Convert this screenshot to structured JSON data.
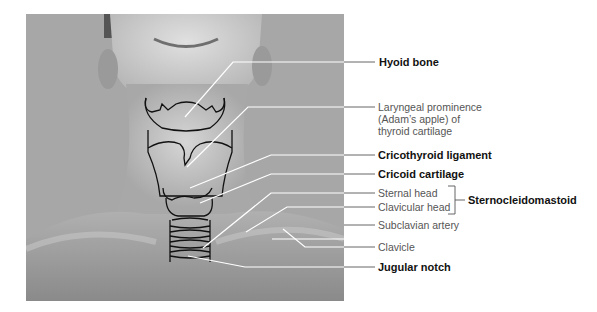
{
  "figure": {
    "photo_colors": {
      "background": "#a9a9a9",
      "skin_light": "#d8d8d8",
      "skin_mid": "#b5b5b5",
      "shadow": "#7a7a7a"
    },
    "line_color": "#ffffff",
    "leader_color": "#555555"
  },
  "labels": [
    {
      "id": "hyoid",
      "text": "Hyoid bone",
      "bold": true
    },
    {
      "id": "laryngeal",
      "text_lines": [
        "Laryngeal prominence",
        "(Adam’s apple) of",
        "thyroid cartilage"
      ],
      "bold": false
    },
    {
      "id": "cricothyroid",
      "text": "Cricothyroid ligament",
      "bold": true
    },
    {
      "id": "cricoid",
      "text": "Cricoid cartilage",
      "bold": true
    },
    {
      "id": "sternal",
      "text": "Sternal head",
      "bold": false
    },
    {
      "id": "clavicular",
      "text": "Clavicular head",
      "bold": false
    },
    {
      "id": "scm",
      "text": "Sternocleidomastoid",
      "bold": true
    },
    {
      "id": "subclavian",
      "text": "Subclavian artery",
      "bold": false
    },
    {
      "id": "clavicle",
      "text": "Clavicle",
      "bold": false
    },
    {
      "id": "jugular",
      "text": "Jugular notch",
      "bold": true
    }
  ]
}
